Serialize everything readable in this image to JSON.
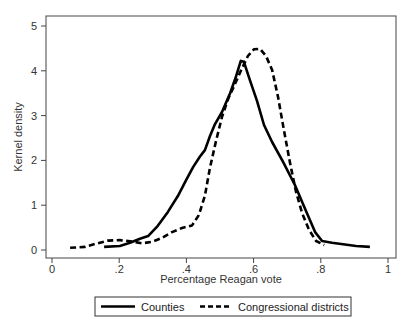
{
  "chart_data": {
    "type": "line",
    "title": "",
    "xlabel": "Percentage Reagan vote",
    "ylabel": "Kernel density",
    "xlim": [
      0,
      1
    ],
    "ylim": [
      0,
      5
    ],
    "xticks": [
      0,
      0.2,
      0.4,
      0.6,
      0.8,
      1
    ],
    "xtick_labels": [
      "0",
      ".2",
      ".4",
      ".6",
      ".8",
      "1"
    ],
    "yticks": [
      0,
      1,
      2,
      3,
      4,
      5
    ],
    "ytick_labels": [
      "0",
      "1",
      "2",
      "3",
      "4",
      "5"
    ],
    "grid": false,
    "legend_position": "bottom",
    "series": [
      {
        "name": "Counties",
        "style": "solid",
        "color": "#000000",
        "x": [
          0.155,
          0.202,
          0.232,
          0.262,
          0.286,
          0.315,
          0.345,
          0.375,
          0.399,
          0.42,
          0.44,
          0.455,
          0.47,
          0.485,
          0.506,
          0.53,
          0.548,
          0.562,
          0.571,
          0.589,
          0.61,
          0.631,
          0.655,
          0.688,
          0.723,
          0.756,
          0.783,
          0.804,
          0.833,
          0.905,
          0.946
        ],
        "y": [
          0.07,
          0.09,
          0.16,
          0.25,
          0.31,
          0.54,
          0.85,
          1.21,
          1.56,
          1.85,
          2.08,
          2.23,
          2.54,
          2.81,
          3.08,
          3.5,
          3.88,
          4.22,
          4.2,
          3.79,
          3.33,
          2.79,
          2.41,
          1.96,
          1.45,
          0.87,
          0.4,
          0.2,
          0.16,
          0.09,
          0.07
        ]
      },
      {
        "name": "Congressional districts",
        "style": "dashed",
        "color": "#000000",
        "x": [
          0.054,
          0.098,
          0.131,
          0.167,
          0.202,
          0.238,
          0.268,
          0.298,
          0.327,
          0.357,
          0.387,
          0.417,
          0.437,
          0.455,
          0.47,
          0.488,
          0.506,
          0.524,
          0.545,
          0.563,
          0.583,
          0.601,
          0.619,
          0.637,
          0.655,
          0.673,
          0.69,
          0.708,
          0.726,
          0.744,
          0.765,
          0.786,
          0.81
        ],
        "y": [
          0.05,
          0.07,
          0.14,
          0.21,
          0.22,
          0.19,
          0.15,
          0.18,
          0.27,
          0.4,
          0.49,
          0.55,
          0.78,
          1.21,
          1.83,
          2.43,
          2.97,
          3.37,
          3.71,
          4.02,
          4.33,
          4.48,
          4.49,
          4.33,
          4.02,
          3.41,
          2.69,
          1.96,
          1.31,
          0.83,
          0.45,
          0.2,
          0.11
        ]
      }
    ]
  },
  "legend": {
    "items": [
      {
        "label": "Counties",
        "style": "solid"
      },
      {
        "label": "Congressional districts",
        "style": "dashed"
      }
    ]
  },
  "colors": {
    "frame": "#333333",
    "line": "#000000",
    "background": "#ffffff"
  }
}
